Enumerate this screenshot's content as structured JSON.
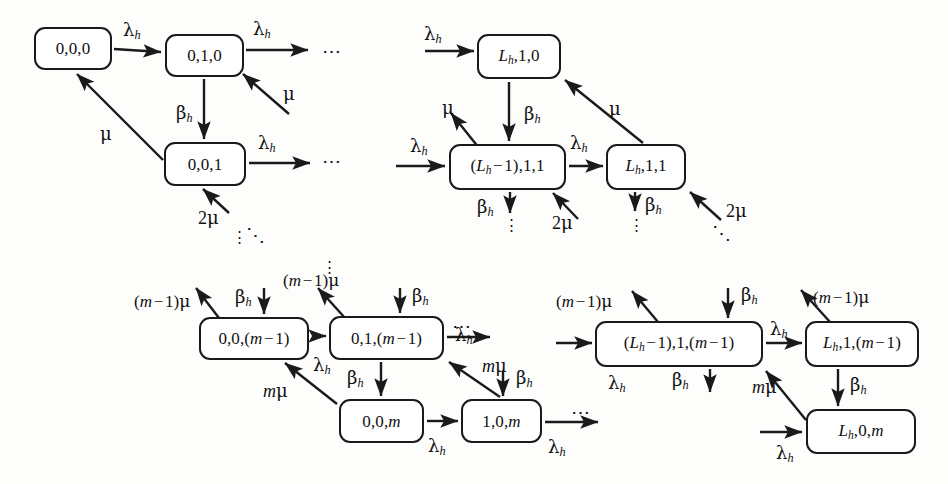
{
  "diagram": {
    "background_color": "#fdfdfc",
    "stroke_color": "#1a1a1a",
    "type": "state-transition-diagram",
    "rates": {
      "lambda_h": "λ",
      "mu": "μ",
      "beta_h": "β",
      "two_mu": "2μ",
      "m_mu": "mμ",
      "m_minus_1_mu": "(m − 1)μ"
    }
  },
  "states": [
    {
      "id": "s-000",
      "label": "0,0,0",
      "x": 34,
      "y": 27,
      "w": 78,
      "h": 43,
      "font": 17
    },
    {
      "id": "s-010",
      "label": "0,1,0",
      "x": 165,
      "y": 34,
      "w": 79,
      "h": 43,
      "font": 17
    },
    {
      "id": "s-001",
      "label": "0,0,1",
      "x": 164,
      "y": 142,
      "w": 82,
      "h": 44,
      "font": 17
    },
    {
      "id": "s-Lh10",
      "label": "L_h,1,0",
      "x": 477,
      "y": 34,
      "w": 84,
      "h": 45,
      "font": 17
    },
    {
      "id": "s-Lhm1-11",
      "label": "(L_h − 1),1,1",
      "x": 449,
      "y": 144,
      "w": 117,
      "h": 46,
      "font": 17
    },
    {
      "id": "s-Lh11",
      "label": "L_h,1,1",
      "x": 606,
      "y": 144,
      "w": 80,
      "h": 46,
      "font": 17
    },
    {
      "id": "s-00m1",
      "label": "0,0,(m − 1)",
      "x": 199,
      "y": 317,
      "w": 110,
      "h": 43,
      "font": 17
    },
    {
      "id": "s-01m1",
      "label": "0,1,(m − 1)",
      "x": 329,
      "y": 316,
      "w": 115,
      "h": 44,
      "font": 17
    },
    {
      "id": "s-00m",
      "label": "0,0,m",
      "x": 339,
      "y": 399,
      "w": 85,
      "h": 44,
      "font": 17
    },
    {
      "id": "s-10m",
      "label": "1,0,m",
      "x": 461,
      "y": 399,
      "w": 81,
      "h": 44,
      "font": 17
    },
    {
      "id": "s-Lhm1-1m1",
      "label": "(L_h − 1),1,(m − 1)",
      "x": 595,
      "y": 321,
      "w": 168,
      "h": 46,
      "font": 17
    },
    {
      "id": "s-Lh1m1",
      "label": "L_h,1,(m − 1)",
      "x": 805,
      "y": 321,
      "w": 114,
      "h": 46,
      "font": 17
    },
    {
      "id": "s-Lh0m",
      "label": "L_h,0,m",
      "x": 806,
      "y": 409,
      "w": 110,
      "h": 45,
      "font": 17
    }
  ],
  "rate_labels": [
    {
      "id": "r1",
      "text": "λ_h",
      "x": 123,
      "y": 21,
      "font": 18
    },
    {
      "id": "r2",
      "text": "λ_h",
      "x": 253,
      "y": 20,
      "font": 18
    },
    {
      "id": "r3",
      "text": "μ",
      "x": 283,
      "y": 85,
      "font": 18
    },
    {
      "id": "r4",
      "text": "β_h",
      "x": 176,
      "y": 104,
      "font": 18
    },
    {
      "id": "r5",
      "text": "μ",
      "x": 100,
      "y": 125,
      "font": 18
    },
    {
      "id": "r6",
      "text": "λ_h",
      "x": 258,
      "y": 134,
      "font": 18
    },
    {
      "id": "r7",
      "text": "2μ",
      "x": 198,
      "y": 209,
      "font": 18
    },
    {
      "id": "r8",
      "text": "λ_h",
      "x": 424,
      "y": 25,
      "font": 18
    },
    {
      "id": "r9",
      "text": "β_h",
      "x": 524,
      "y": 105,
      "font": 18
    },
    {
      "id": "r10",
      "text": "μ",
      "x": 609,
      "y": 100,
      "font": 18
    },
    {
      "id": "r11",
      "text": "μ",
      "x": 442,
      "y": 99,
      "font": 18
    },
    {
      "id": "r12",
      "text": "λ_h",
      "x": 410,
      "y": 137,
      "font": 18
    },
    {
      "id": "r13",
      "text": "λ_h",
      "x": 570,
      "y": 134,
      "font": 18
    },
    {
      "id": "r14",
      "text": "β_h",
      "x": 477,
      "y": 198,
      "font": 18
    },
    {
      "id": "r15",
      "text": "2μ",
      "x": 552,
      "y": 214,
      "font": 18
    },
    {
      "id": "r16",
      "text": "β_h",
      "x": 626,
      "y": 196,
      "font": 18
    },
    {
      "id": "r17",
      "text": "2μ",
      "x": 710,
      "y": 202,
      "font": 18
    },
    {
      "id": "r18",
      "text": "(m − 1)μ",
      "x": 134,
      "y": 293,
      "font": 17
    },
    {
      "id": "r19",
      "text": "β_h",
      "x": 235,
      "y": 288,
      "font": 18
    },
    {
      "id": "r20",
      "text": "(m − 1)μ",
      "x": 283,
      "y": 272,
      "font": 17
    },
    {
      "id": "r21",
      "text": "β_h",
      "x": 375,
      "y": 287,
      "font": 18
    },
    {
      "id": "r22",
      "text": "λ_h",
      "x": 455,
      "y": 326,
      "font": 18
    },
    {
      "id": "r23",
      "text": "λ_h",
      "x": 313,
      "y": 358,
      "font": 18
    },
    {
      "id": "r24",
      "text": "β_h",
      "x": 347,
      "y": 372,
      "font": 18
    },
    {
      "id": "r25",
      "text": "mμ",
      "x": 263,
      "y": 382,
      "font": 18
    },
    {
      "id": "r26",
      "text": "mμ",
      "x": 482,
      "y": 369,
      "font": 18
    },
    {
      "id": "r27",
      "text": "β_h",
      "x": 508,
      "y": 372,
      "font": 18
    },
    {
      "id": "r28",
      "text": "λ_h",
      "x": 428,
      "y": 437,
      "font": 18
    },
    {
      "id": "r29",
      "text": "λ_h",
      "x": 548,
      "y": 438,
      "font": 18
    },
    {
      "id": "r30",
      "text": "(m − 1)μ",
      "x": 585,
      "y": 293,
      "font": 17
    },
    {
      "id": "r31",
      "text": "β_h",
      "x": 700,
      "y": 286,
      "font": 18
    },
    {
      "id": "r32",
      "text": "(m − 1)μ",
      "x": 813,
      "y": 289,
      "font": 17
    },
    {
      "id": "r33",
      "text": "λ_h",
      "x": 770,
      "y": 322,
      "font": 18
    },
    {
      "id": "r34",
      "text": "λ_h",
      "x": 608,
      "y": 374,
      "font": 18
    },
    {
      "id": "r35",
      "text": "β_h",
      "x": 672,
      "y": 374,
      "font": 18
    },
    {
      "id": "r36",
      "text": "mμ",
      "x": 752,
      "y": 378,
      "font": 18
    },
    {
      "id": "r37",
      "text": "β_h",
      "x": 846,
      "y": 379,
      "font": 18
    },
    {
      "id": "r38",
      "text": "λ_h",
      "x": 776,
      "y": 449,
      "font": 18
    }
  ],
  "ellipses": [
    {
      "id": "e-h1",
      "kind": "horizontal",
      "x": 322,
      "y": 45,
      "font": 19
    },
    {
      "id": "e-h2",
      "kind": "horizontal",
      "x": 322,
      "y": 155,
      "font": 19
    },
    {
      "id": "e-h3",
      "kind": "horizontal",
      "x": 452,
      "y": 320,
      "font": 19
    },
    {
      "id": "e-h4",
      "kind": "horizontal",
      "x": 571,
      "y": 406,
      "font": 19
    },
    {
      "id": "e-v1",
      "kind": "vertical",
      "x": 236,
      "y": 234,
      "font": 15
    },
    {
      "id": "e-v2",
      "kind": "vertical",
      "x": 326,
      "y": 264,
      "font": 15
    },
    {
      "id": "e-v3",
      "kind": "vertical",
      "x": 503,
      "y": 223,
      "font": 15
    },
    {
      "id": "e-v4",
      "kind": "vertical",
      "x": 627,
      "y": 223,
      "font": 15
    },
    {
      "id": "e-d1",
      "kind": "diagonal",
      "x": 248,
      "y": 229,
      "font": 19
    },
    {
      "id": "e-d2",
      "kind": "diagonal",
      "x": 716,
      "y": 228,
      "font": 19
    }
  ],
  "transitions": [
    {
      "from": "0,0,0",
      "to": "0,1,0",
      "rate": "λ_h"
    },
    {
      "from": "0,1,0",
      "to": "outgoing-right",
      "rate": "λ_h"
    },
    {
      "from": "incoming",
      "to": "0,1,0",
      "rate": "μ"
    },
    {
      "from": "0,1,0",
      "to": "0,0,1",
      "rate": "β_h"
    },
    {
      "from": "0,0,1",
      "to": "0,0,0",
      "rate": "μ"
    },
    {
      "from": "0,0,1",
      "to": "outgoing-right",
      "rate": "λ_h"
    },
    {
      "from": "incoming",
      "to": "0,0,1",
      "rate": "2μ"
    },
    {
      "from": "incoming",
      "to": "L_h,1,0",
      "rate": "λ_h"
    },
    {
      "from": "L_h,1,0",
      "to": "(L_h − 1),1,1",
      "rate": "β_h"
    },
    {
      "from": "L_h,1,1",
      "to": "L_h,1,0",
      "rate": "μ"
    },
    {
      "from": "(L_h − 1),1,1",
      "to": "outgoing-up-left",
      "rate": "μ"
    },
    {
      "from": "incoming",
      "to": "(L_h − 1),1,1",
      "rate": "λ_h"
    },
    {
      "from": "(L_h − 1),1,1",
      "to": "L_h,1,1",
      "rate": "λ_h"
    },
    {
      "from": "(L_h − 1),1,1",
      "to": "outgoing-down",
      "rate": "β_h"
    },
    {
      "from": "incoming",
      "to": "(L_h − 1),1,1",
      "rate": "2μ"
    },
    {
      "from": "L_h,1,1",
      "to": "outgoing-down",
      "rate": "β_h"
    },
    {
      "from": "incoming",
      "to": "L_h,1,1",
      "rate": "2μ"
    },
    {
      "from": "0,0,(m − 1)",
      "to": "outgoing-up-left",
      "rate": "(m − 1)μ"
    },
    {
      "from": "incoming-top",
      "to": "0,0,(m − 1)",
      "rate": "β_h"
    },
    {
      "from": "0,0,(m − 1)",
      "to": "0,1,(m − 1)",
      "rate": "λ_h"
    },
    {
      "from": "0,1,(m − 1)",
      "to": "outgoing-up-left",
      "rate": "(m − 1)μ"
    },
    {
      "from": "incoming-top",
      "to": "0,1,(m − 1)",
      "rate": "β_h"
    },
    {
      "from": "0,1,(m − 1)",
      "to": "outgoing-right",
      "rate": "λ_h"
    },
    {
      "from": "0,1,(m − 1)",
      "to": "0,0,m",
      "rate": "β_h"
    },
    {
      "from": "0,0,m",
      "to": "0,0,(m − 1)",
      "rate": "mμ"
    },
    {
      "from": "0,0,m",
      "to": "1,0,m",
      "rate": "λ_h"
    },
    {
      "from": "1,0,m",
      "to": "0,1,(m − 1)",
      "rate": "mμ"
    },
    {
      "from": "incoming-top",
      "to": "1,0,m",
      "rate": "β_h"
    },
    {
      "from": "1,0,m",
      "to": "outgoing-right",
      "rate": "λ_h"
    },
    {
      "from": "(L_h − 1),1,(m − 1)",
      "to": "outgoing-up-left",
      "rate": "(m − 1)μ"
    },
    {
      "from": "incoming-top",
      "to": "(L_h − 1),1,(m − 1)",
      "rate": "β_h"
    },
    {
      "from": "incoming",
      "to": "(L_h − 1),1,(m − 1)",
      "rate": "λ_h"
    },
    {
      "from": "(L_h − 1),1,(m − 1)",
      "to": "L_h,1,(m − 1)",
      "rate": "λ_h"
    },
    {
      "from": "(L_h − 1),1,(m − 1)",
      "to": "outgoing-down",
      "rate": "β_h"
    },
    {
      "from": "L_h,1,(m − 1)",
      "to": "outgoing-up-left",
      "rate": "(m − 1)μ"
    },
    {
      "from": "L_h,1,(m − 1)",
      "to": "L_h,0,m",
      "rate": "β_h"
    },
    {
      "from": "L_h,0,m",
      "to": "(L_h − 1),1,(m − 1)",
      "rate": "mμ"
    },
    {
      "from": "incoming",
      "to": "L_h,0,m",
      "rate": "λ_h"
    }
  ]
}
